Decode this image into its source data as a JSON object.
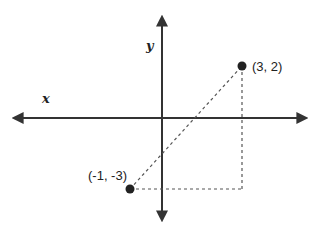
{
  "diagram": {
    "type": "coordinate-plane",
    "axes": {
      "x_label": "x",
      "y_label": "y"
    },
    "points": [
      {
        "label": "(3, 2)",
        "x": 3,
        "y": 2
      },
      {
        "label": "(-1, -3)",
        "x": -1,
        "y": -3
      }
    ],
    "segments": [
      {
        "from": "(-1, -3)",
        "to": "(3, 2)",
        "style": "dashed",
        "role": "hypotenuse"
      },
      {
        "from": "(3, 2)",
        "to": "(3, -3)",
        "style": "dashed",
        "role": "vertical-leg"
      },
      {
        "from": "(-1, -3)",
        "to": "(3, -3)",
        "style": "dashed",
        "role": "horizontal-leg"
      }
    ],
    "colors": {
      "axis": "#333333",
      "point": "#222222",
      "dashed": "#555555"
    }
  }
}
